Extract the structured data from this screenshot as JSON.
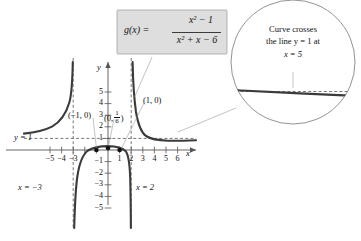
{
  "figure": {
    "formula": {
      "lhs": "g(x) =",
      "numerator": "x² − 1",
      "denominator": "x² + x − 6"
    },
    "callout": {
      "line1": "Curve crosses",
      "line2": "the line y = 1 at",
      "line3": "x = 5"
    },
    "axis_labels": {
      "x": "x",
      "y": "y"
    },
    "asymptotes": {
      "horizontal_label": "y = 1",
      "vertical_left_label": "x = −3",
      "vertical_right_label": "x = 2"
    },
    "points": [
      {
        "label": "(−1, 0)",
        "x": -1,
        "y": 0
      },
      {
        "label": "(0, 1/6)",
        "x": 0,
        "y": 0.1667
      },
      {
        "label": "(1, 0)",
        "x": 1,
        "y": 0
      }
    ],
    "point_label_parts": {
      "p1": "(−1, 0)",
      "p2_open": "(0,",
      "p2_num": "1",
      "p2_den": "6",
      "p2_close": ")",
      "p3": "(1, 0)"
    },
    "xticks": [
      "−5",
      "−4",
      "−3",
      "1",
      "2",
      "3",
      "4",
      "5",
      "6"
    ],
    "yticks": [
      "5",
      "4",
      "3",
      "2",
      "1",
      "−1",
      "−2",
      "−3",
      "−4",
      "−5"
    ],
    "colors": {
      "curve": "#3b3b3b",
      "axis": "#555555",
      "formula_box_fill": "#dedede",
      "formula_box_border": "#9a9a9a",
      "leader": "#9a9a9a"
    }
  },
  "chart_data": {
    "type": "line",
    "title": "",
    "xlabel": "x",
    "ylabel": "y",
    "function": "g(x) = (x^2 - 1)/(x^2 + x - 6)",
    "xlim": [
      -6,
      6.8
    ],
    "ylim": [
      -5.6,
      5.6
    ],
    "grid": false,
    "legend": "none",
    "vertical_asymptotes": [
      -3,
      2
    ],
    "horizontal_asymptote": 1,
    "x_intercepts": [
      -1,
      1
    ],
    "y_intercept": 0.16667,
    "crossing_of_horizontal_asymptote": {
      "x": 5,
      "y": 1
    },
    "xticks": [
      -5,
      -4,
      -3,
      1,
      2,
      3,
      4,
      5,
      6
    ],
    "yticks": [
      5,
      4,
      3,
      2,
      1,
      -1,
      -2,
      -3,
      -4,
      -5
    ],
    "annotations": [
      "y = 1",
      "x = -3",
      "x = 2",
      "(-1, 0)",
      "(0, 1/6)",
      "(1, 0)",
      "Curve crosses the line y = 1 at x = 5"
    ],
    "inset": {
      "type": "magnifier",
      "describes": "curve crossing y = 1 near x = 5",
      "shape": "circle"
    }
  }
}
